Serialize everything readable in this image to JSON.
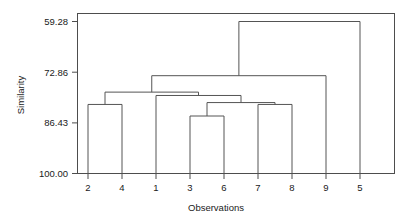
{
  "chart_data": {
    "type": "dendrogram",
    "title": "",
    "xlabel": "Observations",
    "ylabel": "Similarity",
    "grid": false,
    "legend": null,
    "y_axis": {
      "ticks": [
        59.28,
        72.86,
        86.43,
        100.0
      ],
      "tick_labels": [
        "59.28",
        "72.86",
        "86.43",
        "100.00"
      ],
      "ylim": [
        100.0,
        53.83
      ],
      "inverted": true,
      "note": "Similarity decreases upward; leaves sit at 100.00"
    },
    "x_axis": {
      "leaf_order": [
        "2",
        "4",
        "1",
        "3",
        "6",
        "7",
        "8",
        "9",
        "5"
      ],
      "tick_labels": [
        "2",
        "4",
        "1",
        "3",
        "6",
        "7",
        "8",
        "9",
        "5"
      ],
      "n_observations": 9
    },
    "leaves": [
      {
        "label": "2",
        "position": 1
      },
      {
        "label": "4",
        "position": 2
      },
      {
        "label": "1",
        "position": 3
      },
      {
        "label": "3",
        "position": 4
      },
      {
        "label": "6",
        "position": 5
      },
      {
        "label": "7",
        "position": 6
      },
      {
        "label": "8",
        "position": 7
      },
      {
        "label": "9",
        "position": 8
      },
      {
        "label": "5",
        "position": 9
      }
    ],
    "merges": [
      {
        "id": "m1",
        "left": "2",
        "right": "4",
        "similarity": 81.5,
        "members": [
          "2",
          "4"
        ]
      },
      {
        "id": "m2",
        "left": "3",
        "right": "6",
        "similarity": 84.6,
        "members": [
          "3",
          "6"
        ]
      },
      {
        "id": "m3",
        "left": "7",
        "right": "8",
        "similarity": 81.5,
        "members": [
          "7",
          "8"
        ]
      },
      {
        "id": "m4",
        "left": "m2",
        "right": "m3",
        "similarity": 81.0,
        "members": [
          "3",
          "6",
          "7",
          "8"
        ]
      },
      {
        "id": "m5",
        "left": "1",
        "right": "m4",
        "similarity": 79.1,
        "members": [
          "1",
          "3",
          "6",
          "7",
          "8"
        ]
      },
      {
        "id": "m6",
        "left": "m1",
        "right": "m5",
        "similarity": 78.2,
        "members": [
          "2",
          "4",
          "1",
          "3",
          "6",
          "7",
          "8"
        ]
      },
      {
        "id": "m7",
        "left": "m6",
        "right": "9",
        "similarity": 73.8,
        "members": [
          "2",
          "4",
          "1",
          "3",
          "6",
          "7",
          "8",
          "9"
        ]
      },
      {
        "id": "m8",
        "left": "m7",
        "right": "5",
        "similarity": 59.28,
        "members": [
          "2",
          "4",
          "1",
          "3",
          "6",
          "7",
          "8",
          "9",
          "5"
        ]
      }
    ],
    "colors": {
      "link": "#545454",
      "frame": "#4d4d4d",
      "text": "#1a1a1a",
      "background": "#ffffff"
    }
  }
}
